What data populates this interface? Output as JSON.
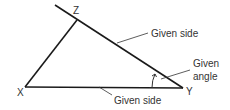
{
  "diagram": {
    "type": "triangle-construction",
    "vertices": [
      {
        "name": "X",
        "label": "X"
      },
      {
        "name": "Y",
        "label": "Y"
      },
      {
        "name": "Z",
        "label": "Z"
      }
    ],
    "annotations": {
      "side_zy": "Given side",
      "side_xy": "Given side",
      "angle_line1": "Given",
      "angle_line2": "angle"
    },
    "colors": {
      "line": "#1a1a1a",
      "text": "#333333"
    }
  }
}
